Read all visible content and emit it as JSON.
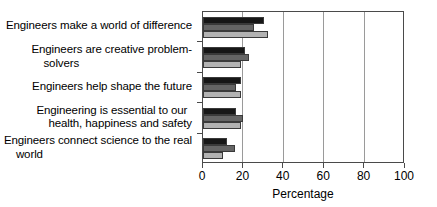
{
  "chart_data": {
    "type": "bar",
    "orientation": "horizontal",
    "title": "",
    "xlabel": "Percentage",
    "ylabel": "",
    "xlim": [
      0,
      100
    ],
    "xticks": [
      0,
      20,
      40,
      60,
      80,
      100
    ],
    "grid": true,
    "grid_axis": "x",
    "legend": false,
    "categories": [
      "Engineers make a world of difference",
      "Engineers are creative problem-solvers",
      "Engineers help shape the future",
      "Engineering is essential to our health, happiness and safety",
      "Engineers connect science to the real world"
    ],
    "category_lines": [
      [
        "Engineers make a world of difference"
      ],
      [
        "Engineers are creative problem-",
        "solvers"
      ],
      [
        "Engineers help shape the future"
      ],
      [
        "Engineering is essential to our",
        "health, happiness and safety"
      ],
      [
        "Engineers connect science to the real",
        "world"
      ]
    ],
    "series": [
      {
        "name": "series-1",
        "color": "#171717",
        "values": [
          30,
          21,
          19,
          16.5,
          12
        ]
      },
      {
        "name": "series-2",
        "color": "#656565",
        "values": [
          25,
          23,
          16.5,
          20,
          16
        ]
      },
      {
        "name": "series-3",
        "color": "#b2b2b2",
        "values": [
          32,
          19,
          19,
          19,
          10
        ]
      }
    ]
  },
  "axis": {
    "x_tick_labels": [
      "0",
      "20",
      "40",
      "60",
      "80",
      "100"
    ],
    "x_title": "Percentage"
  },
  "colors": {
    "series_1": "#171717",
    "series_2": "#656565",
    "series_3": "#b2b2b2",
    "frame": "#4a4a4a",
    "grid": "#9a9a9a",
    "background": "#ffffff",
    "text": "#000000"
  }
}
